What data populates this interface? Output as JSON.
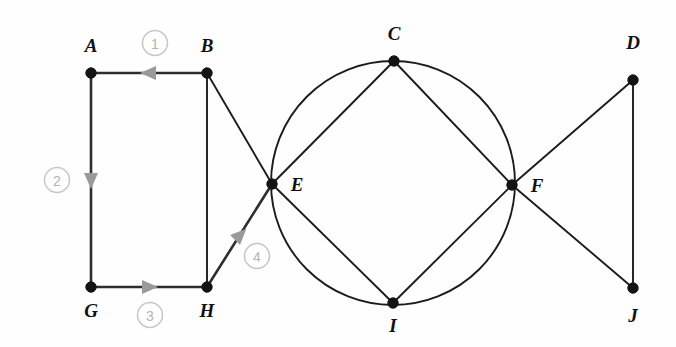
{
  "figure": {
    "canvas": {
      "width": 676,
      "height": 347,
      "background": "#fefefe"
    },
    "colors": {
      "edge": "#1c1c1c",
      "path_edge": "#2e2e2e",
      "node": "#141414",
      "label": "#111111",
      "marker_stroke": "#c6c6c6",
      "marker_text": "#b4b4b4",
      "arrow": "#9a9a9a"
    }
  },
  "nodes": [
    {
      "id": "A",
      "label": "A",
      "x": 91,
      "y": 73,
      "label_x": 91,
      "label_y": 48
    },
    {
      "id": "B",
      "label": "B",
      "x": 207,
      "y": 73,
      "label_x": 207,
      "label_y": 48
    },
    {
      "id": "C",
      "label": "C",
      "x": 394,
      "y": 61,
      "label_x": 394,
      "label_y": 36
    },
    {
      "id": "D",
      "label": "D",
      "x": 633,
      "y": 80,
      "label_x": 633,
      "label_y": 45
    },
    {
      "id": "E",
      "label": "E",
      "x": 272,
      "y": 184,
      "label_x": 297,
      "label_y": 187
    },
    {
      "id": "F",
      "label": "F",
      "x": 512,
      "y": 185,
      "label_x": 537,
      "label_y": 188
    },
    {
      "id": "G",
      "label": "G",
      "x": 91,
      "y": 287,
      "label_x": 91,
      "label_y": 313
    },
    {
      "id": "H",
      "label": "H",
      "x": 207,
      "y": 287,
      "label_x": 207,
      "label_y": 313
    },
    {
      "id": "I",
      "label": "I",
      "x": 393,
      "y": 303,
      "label_x": 393,
      "label_y": 328
    },
    {
      "id": "J",
      "label": "J",
      "x": 633,
      "y": 288,
      "label_x": 633,
      "label_y": 318
    }
  ],
  "circle": {
    "cx": 393,
    "cy": 183,
    "r": 122,
    "through": [
      "C",
      "E",
      "F",
      "I"
    ]
  },
  "edges": [
    {
      "from": "A",
      "to": "B",
      "highlighted": true
    },
    {
      "from": "A",
      "to": "G",
      "highlighted": true
    },
    {
      "from": "B",
      "to": "H",
      "highlighted": false
    },
    {
      "from": "B",
      "to": "E",
      "highlighted": false
    },
    {
      "from": "G",
      "to": "H",
      "highlighted": true
    },
    {
      "from": "H",
      "to": "E",
      "highlighted": true
    },
    {
      "from": "E",
      "to": "C",
      "highlighted": false
    },
    {
      "from": "E",
      "to": "I",
      "highlighted": false
    },
    {
      "from": "C",
      "to": "F",
      "highlighted": false
    },
    {
      "from": "I",
      "to": "F",
      "highlighted": false
    },
    {
      "from": "F",
      "to": "D",
      "highlighted": false
    },
    {
      "from": "F",
      "to": "J",
      "highlighted": false
    },
    {
      "from": "D",
      "to": "J",
      "highlighted": false
    }
  ],
  "traversal_steps": [
    {
      "number": "1",
      "edge": "B-A",
      "from": "B",
      "to": "A",
      "marker_x": 155,
      "marker_y": 43,
      "arrow_x": 149,
      "arrow_y": 73,
      "arrow_angle": 180
    },
    {
      "number": "2",
      "edge": "A-G",
      "from": "A",
      "to": "G",
      "marker_x": 57,
      "marker_y": 180,
      "arrow_x": 91,
      "arrow_y": 180,
      "arrow_angle": 90
    },
    {
      "number": "3",
      "edge": "G-H",
      "from": "G",
      "to": "H",
      "marker_x": 150,
      "marker_y": 315,
      "arrow_x": 149,
      "arrow_y": 287,
      "arrow_angle": 0
    },
    {
      "number": "4",
      "edge": "H-E",
      "from": "H",
      "to": "E",
      "marker_x": 257,
      "marker_y": 256,
      "arrow_x": 240,
      "arrow_y": 235,
      "arrow_angle": -45
    }
  ]
}
